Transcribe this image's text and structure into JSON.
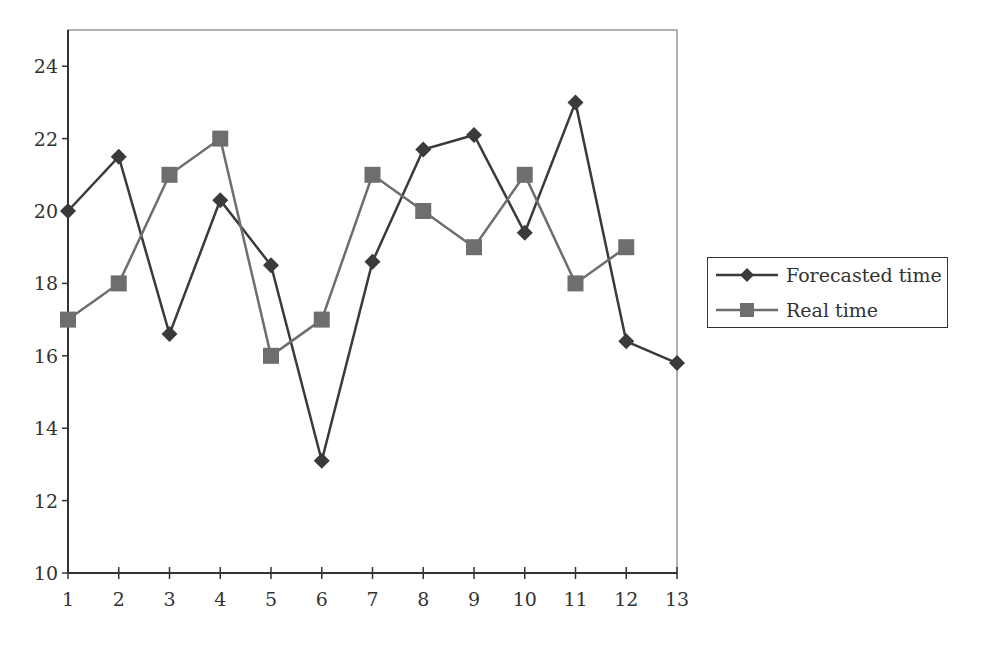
{
  "chart_data": {
    "type": "line",
    "title": "",
    "xlabel": "",
    "ylabel": "",
    "x": [
      1,
      2,
      3,
      4,
      5,
      6,
      7,
      8,
      9,
      10,
      11,
      12,
      13
    ],
    "xticks": [
      "1",
      "2",
      "3",
      "4",
      "5",
      "6",
      "7",
      "8",
      "9",
      "10",
      "11",
      "12",
      "13"
    ],
    "yticks": [
      "10",
      "12",
      "14",
      "16",
      "18",
      "20",
      "22",
      "24"
    ],
    "ylim": [
      10,
      25
    ],
    "xlim": [
      1,
      13
    ],
    "grid": false,
    "legend_position": "right",
    "series": [
      {
        "name": "Forecasted time",
        "marker": "diamond",
        "color": "#3a3a3a",
        "values": [
          20.0,
          21.5,
          16.6,
          20.3,
          18.5,
          13.1,
          18.6,
          21.7,
          22.1,
          19.4,
          23.0,
          16.4,
          15.8
        ]
      },
      {
        "name": "Real time",
        "marker": "square",
        "color": "#6e6e6e",
        "values": [
          17,
          18,
          21,
          22,
          16,
          17,
          21,
          20,
          19,
          21,
          18,
          19,
          null
        ]
      }
    ]
  },
  "legend": {
    "items": [
      {
        "label": "Forecasted time"
      },
      {
        "label": "Real time"
      }
    ]
  }
}
